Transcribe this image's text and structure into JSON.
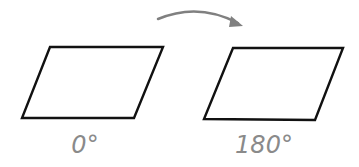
{
  "diagram": {
    "title": "",
    "colors": {
      "shape_stroke": "#111111",
      "arrow": "#808080",
      "label": "#8a8a8a",
      "background": "#ffffff"
    },
    "shapes": [
      {
        "id": "parallelogram-original",
        "label": "0°"
      },
      {
        "id": "parallelogram-rotated",
        "label": "180°"
      }
    ],
    "arrow": {
      "direction": "left-to-right",
      "meaning": "rotation"
    }
  }
}
